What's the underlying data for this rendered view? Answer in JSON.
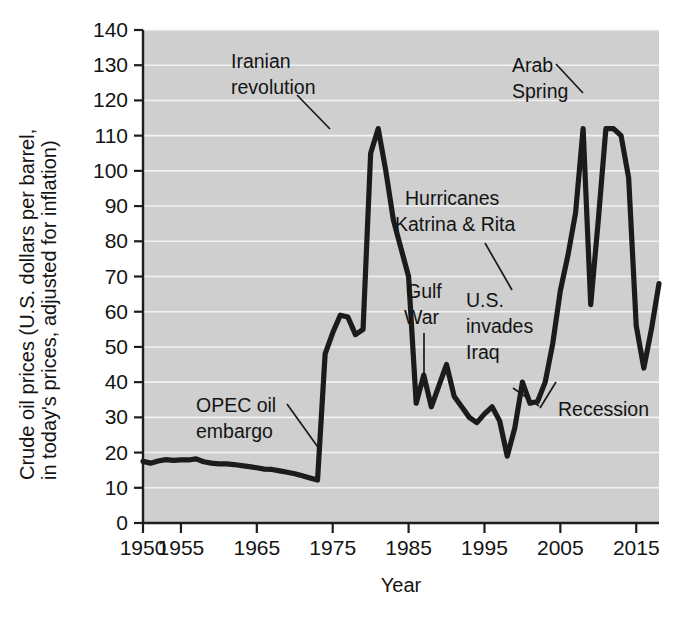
{
  "chart_data": {
    "type": "line",
    "title": "",
    "xlabel": "Year",
    "ylabel_line1": "Crude oil prices (U.S. dollars per barrel,",
    "ylabel_line2": "in today's prices, adjusted for inflation)",
    "xlim": [
      1950,
      2018
    ],
    "ylim": [
      0,
      140
    ],
    "grid": true,
    "legend": "none",
    "xticks": [
      1950,
      1955,
      1965,
      1975,
      1985,
      1995,
      2005,
      2015
    ],
    "xtick_labels": [
      "1950",
      "1955",
      "1965",
      "1975",
      "1985",
      "1995",
      "2005",
      "2015"
    ],
    "yticks": [
      0,
      10,
      20,
      30,
      40,
      50,
      60,
      70,
      80,
      90,
      100,
      110,
      120,
      130,
      140
    ],
    "ytick_labels": [
      "0",
      "10",
      "20",
      "30",
      "40",
      "50",
      "60",
      "70",
      "80",
      "90",
      "100",
      "110",
      "120",
      "130",
      "140"
    ],
    "series": [
      {
        "name": "Crude oil price (inflation adjusted)",
        "x": [
          1950,
          1951,
          1952,
          1953,
          1954,
          1955,
          1956,
          1957,
          1958,
          1959,
          1960,
          1961,
          1962,
          1963,
          1964,
          1965,
          1966,
          1967,
          1968,
          1969,
          1970,
          1971,
          1972,
          1973,
          1974,
          1975,
          1976,
          1977,
          1978,
          1979,
          1980,
          1981,
          1982,
          1983,
          1984,
          1985,
          1986,
          1987,
          1988,
          1989,
          1990,
          1991,
          1992,
          1993,
          1994,
          1995,
          1996,
          1997,
          1998,
          1999,
          2000,
          2001,
          2002,
          2003,
          2004,
          2005,
          2006,
          2007,
          2008,
          2009,
          2010,
          2011,
          2012,
          2013,
          2014,
          2015,
          2016,
          2017,
          2018
        ],
        "y": [
          17.5,
          17.0,
          17.6,
          18.0,
          17.8,
          17.9,
          17.9,
          18.2,
          17.4,
          17.0,
          16.8,
          16.8,
          16.6,
          16.3,
          16.0,
          15.7,
          15.3,
          15.2,
          14.8,
          14.4,
          14.0,
          13.4,
          12.8,
          12.2,
          48.0,
          54.0,
          59.0,
          58.5,
          53.5,
          55.0,
          105.0,
          112.0,
          100.0,
          86.0,
          78.0,
          70.0,
          34.0,
          42.0,
          33.0,
          39.0,
          45.0,
          36.0,
          33.0,
          30.0,
          28.5,
          31.0,
          33.0,
          29.0,
          19.0,
          27.0,
          40.0,
          34.0,
          34.5,
          40.0,
          51.0,
          66.0,
          76.0,
          88.0,
          112.0,
          62.0,
          86.0,
          112.0,
          112.0,
          110.0,
          98.0,
          56.0,
          44.0,
          55.0,
          68.0
        ]
      }
    ],
    "annotations": [
      {
        "id": "iranian-revolution",
        "lines": [
          "Iranian",
          "revolution"
        ],
        "x": 1979,
        "y": 112
      },
      {
        "id": "arab-spring",
        "lines": [
          "Arab",
          "Spring"
        ],
        "x": 2011,
        "y": 123
      },
      {
        "id": "hurricanes-katrina-rita",
        "lines": [
          "Hurricanes",
          "Katrina & Rita"
        ],
        "x": 2005,
        "y": 66
      },
      {
        "id": "gulf-war",
        "lines": [
          "Gulf",
          "War"
        ],
        "x": 1990,
        "y": 45
      },
      {
        "id": "us-invades-iraq",
        "lines": [
          "U.S.",
          "invades",
          "Iraq"
        ],
        "x": 2003,
        "y": 40
      },
      {
        "id": "recession",
        "lines": [
          "Recession"
        ],
        "x": 2009,
        "y": 62
      },
      {
        "id": "opec-oil-embargo",
        "lines": [
          "OPEC oil",
          "embargo"
        ],
        "x": 1974,
        "y": 25
      }
    ],
    "colors": {
      "plot_background": "#cfcfcf",
      "gridline": "#f2f2f2",
      "line": "#1b1b1b",
      "axis": "#1d1d1d",
      "text": "#141414",
      "page_background": "#ffffff"
    }
  }
}
